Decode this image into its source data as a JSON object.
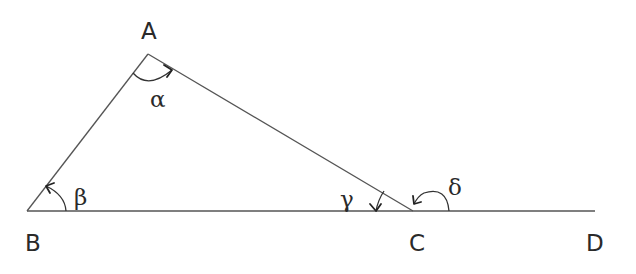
{
  "diagram": {
    "type": "geometry-triangle-exterior-angle",
    "vertices": {
      "A": {
        "label": "A",
        "x": 148,
        "y": 54
      },
      "B": {
        "label": "B",
        "x": 27,
        "y": 211
      },
      "C": {
        "label": "C",
        "x": 413,
        "y": 211
      },
      "D": {
        "label": "D",
        "x": 595,
        "y": 211
      }
    },
    "segments": [
      {
        "from": "A",
        "to": "B"
      },
      {
        "from": "A",
        "to": "C"
      },
      {
        "from": "B",
        "to": "D"
      }
    ],
    "angles": {
      "alpha": {
        "label": "α",
        "vertex": "A"
      },
      "beta": {
        "label": "β",
        "vertex": "B"
      },
      "gamma": {
        "label": "γ",
        "vertex": "C",
        "kind": "interior"
      },
      "delta": {
        "label": "δ",
        "vertex": "C",
        "kind": "exterior"
      }
    },
    "colors": {
      "line": "#555555",
      "text": "#2a2a2a",
      "background": "#ffffff"
    }
  }
}
